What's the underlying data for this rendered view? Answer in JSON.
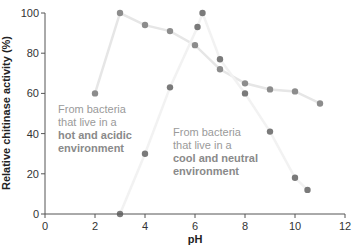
{
  "chart_data": {
    "type": "line",
    "title": "",
    "xlabel": "pH",
    "ylabel": "Relative chitinase activity (%)",
    "xlim": [
      0,
      12
    ],
    "ylim": [
      0,
      100
    ],
    "x_ticks": [
      0,
      2,
      4,
      6,
      8,
      10,
      12
    ],
    "y_ticks": [
      0,
      20,
      40,
      60,
      80,
      100
    ],
    "grid": false,
    "legend": "none (inline annotations)",
    "series": [
      {
        "name": "From bacteria that live in a hot and acidic environment",
        "color": "#e6e6e6",
        "marker_color": "#8c8c8c",
        "x": [
          2,
          3,
          4,
          5,
          6,
          7,
          8,
          9,
          10,
          11
        ],
        "y": [
          60,
          100,
          94,
          91,
          84,
          72,
          65,
          62,
          61,
          55
        ]
      },
      {
        "name": "From bacteria that live in a cool and neutral environment",
        "color": "#f2f2f2",
        "marker_color": "#7a7a7a",
        "x": [
          3,
          4,
          5,
          6.1,
          6.3,
          7,
          8,
          9,
          10,
          10.5
        ],
        "y": [
          0,
          30,
          63,
          93,
          100,
          77,
          60,
          41,
          18,
          12
        ]
      }
    ],
    "annotations": [
      {
        "line1": "From bacteria",
        "line2": "that live in a",
        "line3": "hot and acidic",
        "line4": "environment"
      },
      {
        "line1": "From bacteria",
        "line2": "that live in a",
        "line3": "cool and neutral",
        "line4": "environment"
      }
    ]
  }
}
